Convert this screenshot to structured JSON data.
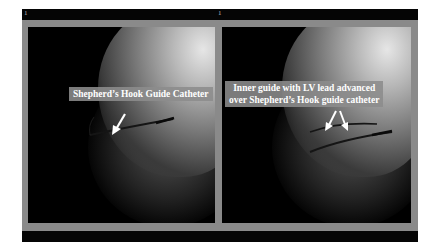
{
  "figure": {
    "frame_numbers": [
      "1",
      "1"
    ],
    "panels": [
      {
        "id": "left",
        "annotation": "Shepherd’s Hook Guide Catheter",
        "arrows": 1
      },
      {
        "id": "right",
        "annotation_line1": "Inner guide with LV lead advanced",
        "annotation_line2": "over Shepherd’s Hook guide catheter",
        "arrows": 2
      }
    ],
    "colors": {
      "border": "#8a8a8a",
      "bars": "#050505",
      "label_bg": "#8c8c8c",
      "label_text": "#ffffff"
    }
  }
}
